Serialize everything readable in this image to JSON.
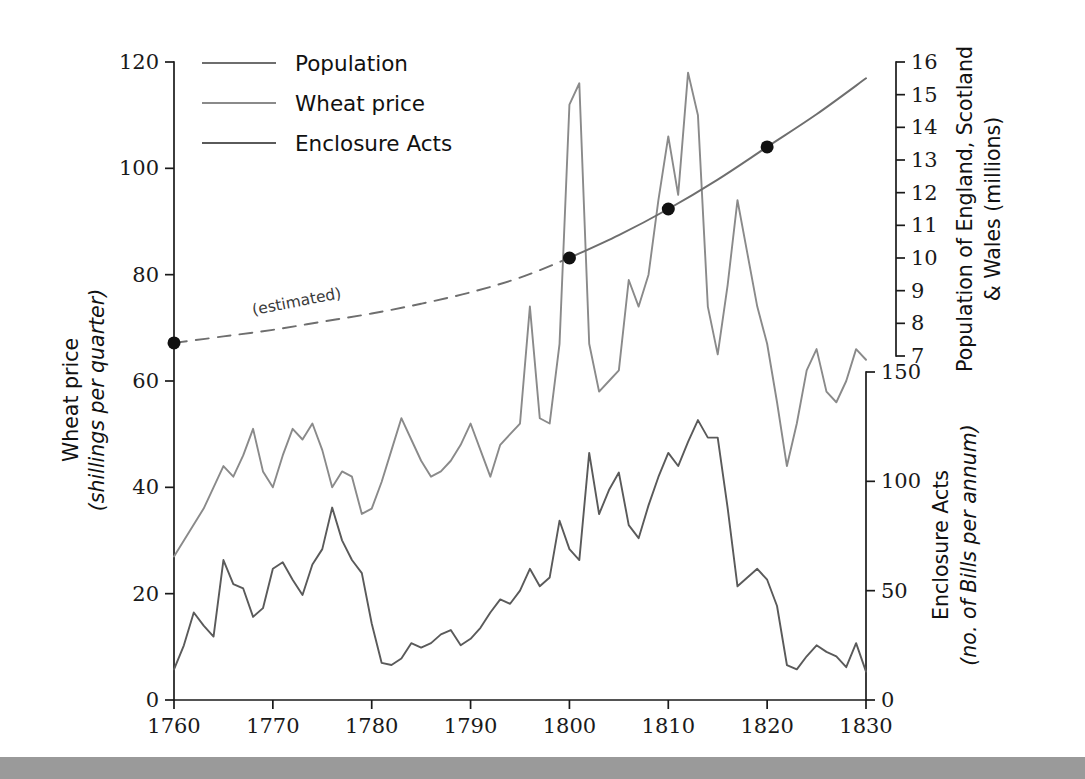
{
  "figure": {
    "background_color": "#ffffff",
    "bottom_bar_color": "#9a9a9a"
  },
  "legend": {
    "position": "top-left-inside",
    "items": [
      {
        "label": "Population",
        "color": "#6e6e6e"
      },
      {
        "label": "Wheat price",
        "color": "#8a8a8a"
      },
      {
        "label": "Enclosure Acts",
        "color": "#5a5a5a"
      }
    ]
  },
  "annotations": [
    {
      "text": "(estimated)",
      "x_year": 1772.5,
      "y_value": 74,
      "rotation": -11
    }
  ],
  "axes": {
    "x": {
      "label": "",
      "min": 1760,
      "max": 1830,
      "ticks": [
        1760,
        1770,
        1780,
        1790,
        1800,
        1810,
        1820,
        1830
      ],
      "tick_labels": [
        "1760",
        "1770",
        "1780",
        "1790",
        "1800",
        "1810",
        "1820",
        "1830"
      ]
    },
    "y_left": {
      "title_line1": "Wheat price",
      "title_line2": "(shillings per quarter)",
      "min": 0,
      "max": 120,
      "ticks": [
        0,
        20,
        40,
        60,
        80,
        100,
        120
      ],
      "tick_labels": [
        "0",
        "20",
        "40",
        "60",
        "80",
        "100",
        "120"
      ]
    },
    "y_right_upper": {
      "title_line1": "Population of England, Scotland",
      "title_line2": "& Wales (millions)",
      "min": 7,
      "max": 16,
      "ticks": [
        7,
        8,
        9,
        10,
        11,
        12,
        13,
        14,
        15,
        16
      ],
      "tick_labels": [
        "7",
        "8",
        "9",
        "10",
        "11",
        "12",
        "13",
        "14",
        "15",
        "16"
      ]
    },
    "y_right_lower": {
      "title_line1": "Enclosure Acts",
      "title_line2": "(no. of Bills per annum)",
      "min": 0,
      "max": 150,
      "ticks": [
        0,
        50,
        100,
        150
      ],
      "tick_labels": [
        "0",
        "50",
        "100",
        "150"
      ]
    }
  },
  "chart_data": {
    "type": "line",
    "title": "",
    "xlabel": "",
    "ylabel": "Wheat price (shillings per quarter)",
    "xlim": [
      1760,
      1830
    ],
    "ylim": [
      0,
      120
    ],
    "grid": false,
    "legend_position": "upper left",
    "series": [
      {
        "name": "Population",
        "axis": "y_right_upper",
        "units": "millions",
        "color": "#6e6e6e",
        "style_estimated": "dashed",
        "style_measured": "solid",
        "estimated_until_year": 1800,
        "markers_at_years": [
          1760,
          1800,
          1810,
          1820
        ],
        "x": [
          1760,
          1765,
          1770,
          1775,
          1780,
          1785,
          1790,
          1795,
          1800,
          1805,
          1810,
          1815,
          1820,
          1825,
          1830
        ],
        "values": [
          7.4,
          7.6,
          7.8,
          8.05,
          8.3,
          8.6,
          8.95,
          9.4,
          10.0,
          10.7,
          11.5,
          12.4,
          13.4,
          14.4,
          15.5
        ]
      },
      {
        "name": "Wheat price",
        "axis": "y_left",
        "units": "shillings per quarter",
        "color": "#8a8a8a",
        "x": [
          1760,
          1761,
          1762,
          1763,
          1764,
          1765,
          1766,
          1767,
          1768,
          1769,
          1770,
          1771,
          1772,
          1773,
          1774,
          1775,
          1776,
          1777,
          1778,
          1779,
          1780,
          1781,
          1782,
          1783,
          1784,
          1785,
          1786,
          1787,
          1788,
          1789,
          1790,
          1791,
          1792,
          1793,
          1794,
          1795,
          1796,
          1797,
          1798,
          1799,
          1800,
          1801,
          1802,
          1803,
          1804,
          1805,
          1806,
          1807,
          1808,
          1809,
          1810,
          1811,
          1812,
          1813,
          1814,
          1815,
          1816,
          1817,
          1818,
          1819,
          1820,
          1821,
          1822,
          1823,
          1824,
          1825,
          1826,
          1827,
          1828,
          1829,
          1830
        ],
        "values": [
          27,
          30,
          33,
          36,
          40,
          44,
          42,
          46,
          51,
          43,
          40,
          46,
          51,
          49,
          52,
          47,
          40,
          43,
          42,
          35,
          36,
          41,
          47,
          53,
          49,
          45,
          42,
          43,
          45,
          48,
          52,
          47,
          42,
          48,
          50,
          52,
          74,
          53,
          52,
          67,
          112,
          116,
          67,
          58,
          60,
          62,
          79,
          74,
          80,
          94,
          106,
          95,
          118,
          110,
          74,
          65,
          78,
          94,
          84,
          74,
          67,
          56,
          44,
          52,
          62,
          66,
          58,
          56,
          60,
          66,
          64
        ]
      },
      {
        "name": "Enclosure Acts",
        "axis": "y_right_lower",
        "units": "no. of Bills per annum",
        "color": "#5a5a5a",
        "x": [
          1760,
          1761,
          1762,
          1763,
          1764,
          1765,
          1766,
          1767,
          1768,
          1769,
          1770,
          1771,
          1772,
          1773,
          1774,
          1775,
          1776,
          1777,
          1778,
          1779,
          1780,
          1781,
          1782,
          1783,
          1784,
          1785,
          1786,
          1787,
          1788,
          1789,
          1790,
          1791,
          1792,
          1793,
          1794,
          1795,
          1796,
          1797,
          1798,
          1799,
          1800,
          1801,
          1802,
          1803,
          1804,
          1805,
          1806,
          1807,
          1808,
          1809,
          1810,
          1811,
          1812,
          1813,
          1814,
          1815,
          1816,
          1817,
          1818,
          1819,
          1820,
          1821,
          1822,
          1823,
          1824,
          1825,
          1826,
          1827,
          1828,
          1829,
          1830
        ],
        "values": [
          14,
          25,
          40,
          34,
          29,
          64,
          53,
          51,
          38,
          42,
          60,
          63,
          55,
          48,
          62,
          69,
          88,
          73,
          64,
          58,
          35,
          17,
          16,
          19,
          26,
          24,
          26,
          30,
          32,
          25,
          28,
          33,
          40,
          46,
          44,
          50,
          60,
          52,
          56,
          82,
          69,
          64,
          113,
          85,
          96,
          104,
          80,
          74,
          89,
          102,
          113,
          107,
          118,
          128,
          120,
          120,
          88,
          52,
          56,
          60,
          55,
          43,
          16,
          14,
          20,
          25,
          22,
          20,
          15,
          26,
          13
        ]
      }
    ]
  }
}
